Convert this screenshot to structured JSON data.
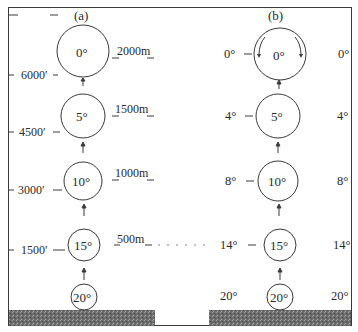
{
  "panels": {
    "a": {
      "label": "(a)",
      "parcels": [
        {
          "temp": "0°",
          "altitude_m": "2000m"
        },
        {
          "temp": "5°",
          "altitude_m": "1500m"
        },
        {
          "temp": "10°",
          "altitude_m": "1000m"
        },
        {
          "temp": "15°",
          "altitude_m": "500m"
        },
        {
          "temp": "20°",
          "altitude_m": ""
        }
      ],
      "feet_axis": [
        "6000′",
        "4500′",
        "3000′",
        "1500′"
      ]
    },
    "b": {
      "label": "(b)",
      "parcels": [
        {
          "temp": "0°",
          "env_left": "0°",
          "env_right": "0°"
        },
        {
          "temp": "5°",
          "env_left": "4°",
          "env_right": "4°"
        },
        {
          "temp": "10°",
          "env_left": "8°",
          "env_right": "8°"
        },
        {
          "temp": "15°",
          "env_left": "14°",
          "env_right": "14°"
        },
        {
          "temp": "20°",
          "env_left": "20°",
          "env_right": "20°"
        }
      ]
    }
  },
  "colors": {
    "line": "#3a3a3a",
    "ground": "#6a6a6a",
    "background": "#ffffff"
  }
}
